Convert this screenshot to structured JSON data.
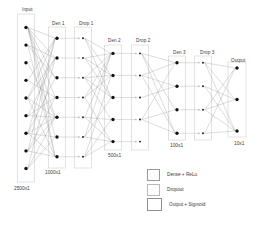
{
  "figure": {
    "background": "#ffffff",
    "node_color": "#111111",
    "edge_color": "#8e8e8e",
    "box_border": "#cfcfcf",
    "text_color": "#3a3a3a"
  },
  "layers": [
    {
      "key": "input",
      "label": "Input",
      "dim": "2500x1",
      "nodes": 9,
      "kind": "input"
    },
    {
      "key": "den1",
      "label": "Den 1",
      "dim": "1000x1",
      "nodes": 7,
      "kind": "dense"
    },
    {
      "key": "drop1",
      "label": "Drop 1",
      "dim": "",
      "nodes": 7,
      "kind": "dropout"
    },
    {
      "key": "den2",
      "label": "Den 2",
      "dim": "500x1",
      "nodes": 5,
      "kind": "dense"
    },
    {
      "key": "drop2",
      "label": "Drop 2",
      "dim": "",
      "nodes": 5,
      "kind": "dropout"
    },
    {
      "key": "den3",
      "label": "Den 3",
      "dim": "100x1",
      "nodes": 4,
      "kind": "dense"
    },
    {
      "key": "drop3",
      "label": "Drop 3",
      "dim": "",
      "nodes": 4,
      "kind": "dropout"
    },
    {
      "key": "output",
      "label": "Output",
      "dim": "10x1",
      "nodes": 3,
      "kind": "output"
    }
  ],
  "labels": {
    "input": "Input",
    "den1": "Den 1",
    "drop1": "Drop 1",
    "den2": "Den 2",
    "drop2": "Drop 2",
    "den3": "Den 3",
    "drop3": "Drop 3",
    "output": "Output"
  },
  "dims": {
    "input": "2500x1",
    "den1": "1000x1",
    "den2": "500x1",
    "den3": "100x1",
    "output": "10x1"
  },
  "legend": {
    "items": [
      {
        "label": "Dense + ReLu",
        "swatch": "dense"
      },
      {
        "label": "Dropout",
        "swatch": "drop"
      },
      {
        "label": "Output + Sigmoid",
        "swatch": "out"
      }
    ]
  }
}
